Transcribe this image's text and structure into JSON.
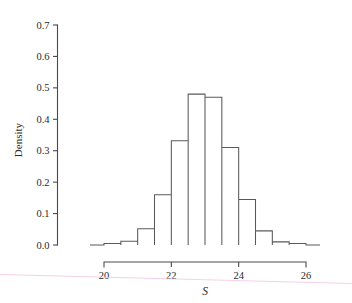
{
  "chart_data": {
    "type": "bar",
    "title": "",
    "subtitle": "",
    "xlabel": "S",
    "ylabel": "Density",
    "grid": false,
    "legend": null,
    "xlim": [
      19.6,
      26.4
    ],
    "ylim": [
      0.0,
      0.7
    ],
    "bin_width": 0.5,
    "x_ticks": [
      "20",
      "22",
      "24",
      "26"
    ],
    "x_tick_values": [
      20,
      22,
      24,
      26
    ],
    "y_ticks": [
      "0.0",
      "0.1",
      "0.2",
      "0.3",
      "0.4",
      "0.5",
      "0.6",
      "0.7"
    ],
    "y_tick_values": [
      0.0,
      0.1,
      0.2,
      0.3,
      0.4,
      0.5,
      0.6,
      0.7
    ],
    "bin_edges": [
      20.0,
      20.5,
      21.0,
      21.5,
      22.0,
      22.5,
      23.0,
      23.5,
      24.0,
      24.5,
      25.0,
      25.5,
      26.0
    ],
    "categories": [
      "20.0-20.5",
      "20.5-21.0",
      "21.0-21.5",
      "21.5-22.0",
      "22.0-22.5",
      "22.5-23.0",
      "23.0-23.5",
      "23.5-24.0",
      "24.0-24.5",
      "24.5-25.0",
      "25.0-25.5",
      "25.5-26.0"
    ],
    "values": [
      0.005,
      0.012,
      0.052,
      0.16,
      0.332,
      0.48,
      0.47,
      0.31,
      0.145,
      0.045,
      0.01,
      0.005
    ],
    "colors": {
      "bar_outline": "#5a5a5a",
      "bar_fill": "none",
      "axis": "#4a4a4a",
      "text": "#2b2b2b",
      "background": "#ffffff",
      "artifact": "#f2c9e0"
    }
  },
  "axes": {
    "y_label": "Density",
    "x_label": "S"
  }
}
